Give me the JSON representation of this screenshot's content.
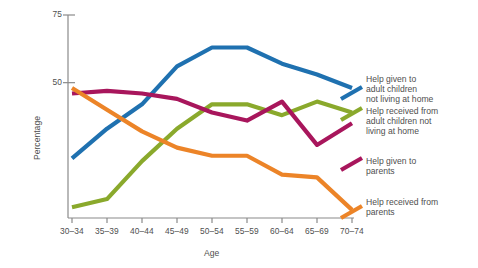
{
  "chart_data": {
    "type": "line",
    "title": "",
    "xlabel": "Age",
    "ylabel": "Percentage",
    "categories": [
      "30–34",
      "35–39",
      "40–44",
      "45–49",
      "50–54",
      "55–59",
      "60–64",
      "65–69",
      "70–74"
    ],
    "ytick_labels": [
      "75",
      "50"
    ],
    "ytick_values": [
      75,
      50
    ],
    "ylim": [
      0,
      75
    ],
    "grid": false,
    "legend_position": "right",
    "series": [
      {
        "name": "Help given to adult children not living at home",
        "color": "#1f71b0",
        "values": [
          22,
          33,
          42,
          56,
          63,
          63,
          57,
          53,
          48
        ]
      },
      {
        "name": "Help received from adult children not living at home",
        "color": "#8aa92c",
        "values": [
          4,
          7,
          21,
          33,
          42,
          42,
          38,
          43,
          39
        ]
      },
      {
        "name": "Help given to parents",
        "color": "#a8165c",
        "values": [
          46,
          47,
          46,
          44,
          39,
          36,
          43,
          27,
          35
        ]
      },
      {
        "name": "Help received from parents",
        "color": "#ec8428",
        "values": [
          48,
          40,
          32,
          26,
          23,
          23,
          16,
          15,
          3
        ]
      }
    ]
  },
  "legend": {
    "items": [
      {
        "label": "Help given to\nadult children\nnot living at home",
        "color": "#1f71b0"
      },
      {
        "label": "Help received from\nadult children not\nliving at home",
        "color": "#8aa92c"
      },
      {
        "label": "Help given to\nparents",
        "color": "#a8165c"
      },
      {
        "label": "Help received from\nparents",
        "color": "#ec8428"
      }
    ]
  }
}
